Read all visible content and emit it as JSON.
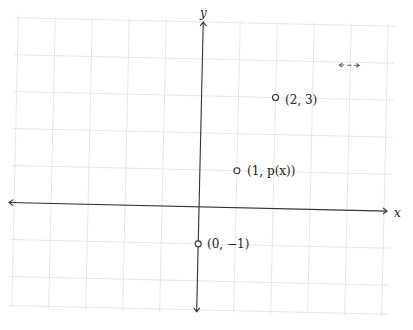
{
  "diagram": {
    "type": "coordinate-plane",
    "axes": {
      "x_label": "x",
      "y_label": "y"
    },
    "points": [
      {
        "coords": [
          0,
          -1
        ],
        "label": "(0, −1)"
      },
      {
        "coords": [
          1,
          "p(x)"
        ],
        "label": "(1, p(x))"
      },
      {
        "coords": [
          2,
          3
        ],
        "label": "(2, 3)"
      }
    ],
    "annotation": {
      "label": "↔",
      "description": "small double-headed dashed arrow"
    },
    "colors": {
      "grid": "#e3e3e3",
      "axis": "#333333",
      "point_stroke": "#333333"
    }
  }
}
